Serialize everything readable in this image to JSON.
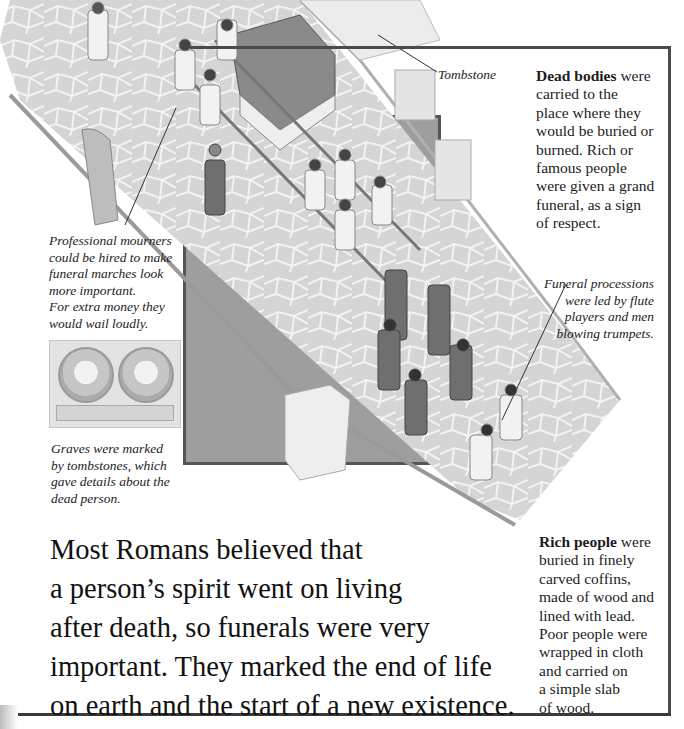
{
  "page": {
    "intro_lines": [
      "Most Romans believed that",
      "a person’s spirit went on living",
      "after death, so funerals were very",
      "important. They marked the end of life",
      "on earth and the start of a new existence."
    ]
  },
  "labels": {
    "tombstone": "Tombstone"
  },
  "blocks": {
    "dead_bodies": {
      "bold": "Dead bodies",
      "lines": [
        " were",
        "carried to the",
        "place where they",
        "would be buried or",
        "burned. Rich or",
        "famous people",
        "were given a grand",
        "funeral, as a sign",
        "of respect."
      ]
    },
    "rich_people": {
      "bold": "Rich people",
      "lines": [
        " were",
        "buried in finely",
        "carved coffins,",
        "made of wood and",
        "lined with lead.",
        "Poor people were",
        "wrapped in cloth",
        "and carried on",
        "a simple slab",
        "of wood."
      ]
    }
  },
  "captions": {
    "mourners": [
      "Professional mourners",
      "could be hired to make",
      "funeral marches look",
      "more important.",
      "For extra money they",
      "would wail loudly."
    ],
    "graves": [
      "Graves were marked",
      "by tombstones, which",
      "gave details about the",
      "dead person."
    ],
    "processions": [
      "Funeral processions",
      "were led by flute",
      "players and men",
      "blowing trumpets."
    ]
  },
  "illustration": {
    "subject": "Roman funeral procession on a stone road",
    "colors": {
      "road": "#d8d8d8",
      "stone_lines": "#f4f4f4",
      "panel": "#9e9e9e",
      "frame": "#4a4a4a",
      "robes": "#6f6f6f"
    }
  }
}
